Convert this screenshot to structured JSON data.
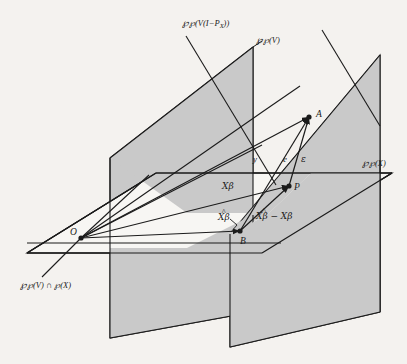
{
  "figure": {
    "width": 407,
    "height": 364,
    "background_color": "#f4f2ef",
    "plane_fill_color": "#c9c9c9",
    "line_color": "#1b1b1b"
  },
  "labels": {
    "space_v_i_minus_px": "℘(V(I−P",
    "space_v_i_minus_px_sub": "X",
    "space_v_i_minus_px_tail": "))",
    "space_v": "℘(V)",
    "space_x": "℘(X)",
    "space_intersection": "℘(V) ∩ ℘(X)",
    "point_o": "O",
    "point_a": "A",
    "point_p": "P",
    "point_b": "B",
    "vector_y": "y",
    "vector_e": "e",
    "vector_epsilon": "ε",
    "vector_xbeta": "Xβ",
    "vector_xhatbeta": "Xβ",
    "vector_xhatbeta_hat": "^",
    "vector_diff": "Xβ − Xβ",
    "vector_diff_hat": "^"
  },
  "geometry": {
    "left_plane_points": "108,160 254,46 254,310 108,336",
    "right_plane_points": "228,236 380,55 380,310 228,345",
    "horizontal_plane_points": "28,252 155,174 390,174 258,252",
    "points": {
      "O": [
        81,
        238
      ],
      "A": [
        309,
        117
      ],
      "P": [
        289,
        186
      ],
      "B": [
        240,
        231
      ]
    }
  },
  "annotations": {
    "description": "Three-dimensional schematic showing the column space of V, the column space of X, their intersection line, the column space of V(I-P_X), the observed vector y from O to A, the fitted values, residual vectors e and epsilon, and the difference between the estimated and true Xbeta."
  }
}
